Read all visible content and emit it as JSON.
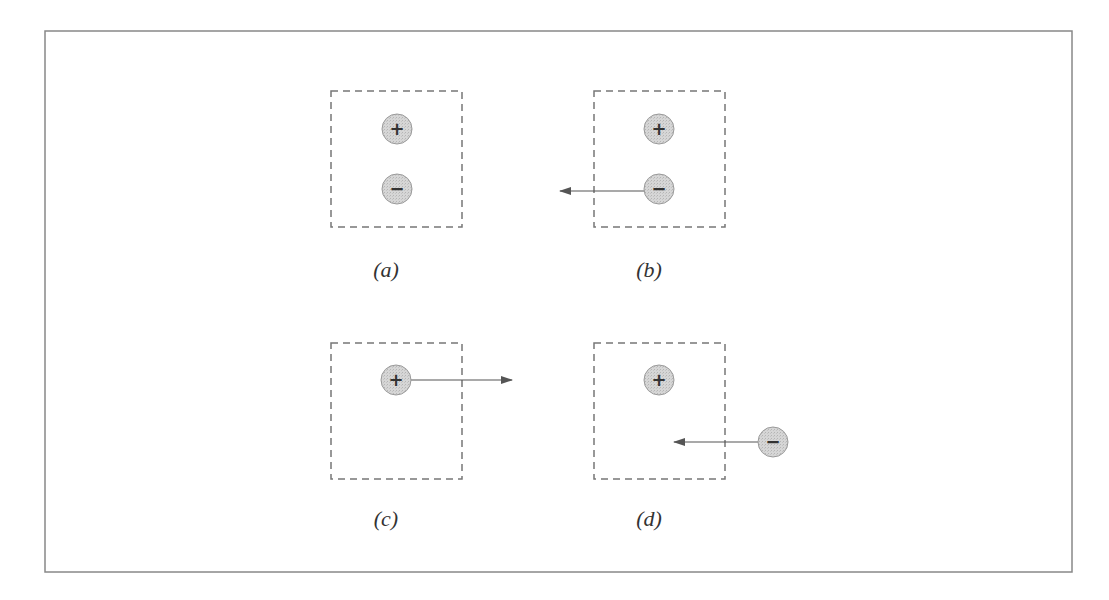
{
  "figure": {
    "frame": {
      "x": 45,
      "y": 31,
      "width": 1027,
      "height": 541,
      "stroke": "#888888"
    },
    "colors": {
      "box_dash": "#777777",
      "charge_fill": "#cfcfcf",
      "charge_stroke": "#9a9a9a",
      "arrow": "#555555",
      "text": "#333333"
    },
    "panels": [
      {
        "id": "a",
        "label": "(a)",
        "box": {
          "x": 331,
          "y": 91,
          "w": 131,
          "h": 136
        },
        "label_pos": {
          "x": 386,
          "y": 277
        },
        "charges": [
          {
            "sign": "+",
            "symbol": "+",
            "cx": 397,
            "cy": 129,
            "r": 15
          },
          {
            "sign": "-",
            "symbol": "−",
            "cx": 397,
            "cy": 189,
            "r": 15
          }
        ],
        "arrows": []
      },
      {
        "id": "b",
        "label": "(b)",
        "box": {
          "x": 594,
          "y": 91,
          "w": 131,
          "h": 136
        },
        "label_pos": {
          "x": 649,
          "y": 277
        },
        "charges": [
          {
            "sign": "+",
            "symbol": "+",
            "cx": 659,
            "cy": 129,
            "r": 15
          },
          {
            "sign": "-",
            "symbol": "−",
            "cx": 659,
            "cy": 189,
            "r": 15
          }
        ],
        "arrows": [
          {
            "from": [
              644,
              191
            ],
            "to": [
              560,
              191
            ],
            "direction": "left"
          }
        ]
      },
      {
        "id": "c",
        "label": "(c)",
        "box": {
          "x": 331,
          "y": 343,
          "w": 131,
          "h": 136
        },
        "label_pos": {
          "x": 386,
          "y": 526
        },
        "charges": [
          {
            "sign": "+",
            "symbol": "+",
            "cx": 396,
            "cy": 380,
            "r": 15
          }
        ],
        "arrows": [
          {
            "from": [
              411,
              380
            ],
            "to": [
              512,
              380
            ],
            "direction": "right"
          }
        ]
      },
      {
        "id": "d",
        "label": "(d)",
        "box": {
          "x": 594,
          "y": 343,
          "w": 131,
          "h": 136
        },
        "label_pos": {
          "x": 649,
          "y": 526
        },
        "charges": [
          {
            "sign": "+",
            "symbol": "+",
            "cx": 659,
            "cy": 380,
            "r": 15
          },
          {
            "sign": "-",
            "symbol": "−",
            "cx": 773,
            "cy": 442,
            "r": 15
          }
        ],
        "arrows": [
          {
            "from": [
              758,
              442
            ],
            "to": [
              674,
              442
            ],
            "direction": "left"
          }
        ]
      }
    ]
  }
}
